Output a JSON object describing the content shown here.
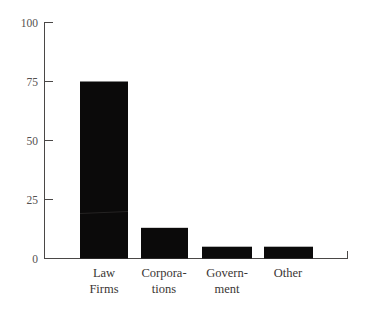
{
  "chart_data": {
    "type": "bar",
    "title": "",
    "subtitle": "",
    "xlabel": "",
    "ylabel": "",
    "categories": [
      "Law Firms",
      "Corporations",
      "Government",
      "Other"
    ],
    "category_label_lines": [
      [
        "Law",
        "Firms"
      ],
      [
        "Corpora-",
        "tions"
      ],
      [
        "Govern-",
        "ment"
      ],
      [
        "Other",
        ""
      ]
    ],
    "values": [
      75,
      13,
      5,
      5
    ],
    "ylim": [
      0,
      100
    ],
    "yticks": [
      0,
      25,
      50,
      75,
      100
    ],
    "ytick_labels": [
      "0",
      "25",
      "50",
      "75",
      "100"
    ],
    "grid": false,
    "legend": null,
    "legend_position": "none",
    "bar_color": "#0b0a0a",
    "axis_color": "#4a4746",
    "text_color": "#3a3634",
    "background_color": "#ffffff"
  },
  "axes": {
    "y_axis_name": "value-axis",
    "x_axis_name": "category-axis"
  }
}
